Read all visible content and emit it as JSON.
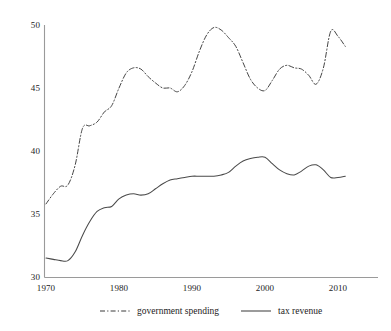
{
  "chart_data": {
    "type": "line",
    "title": "",
    "xlabel": "",
    "ylabel": "",
    "xlim": [
      1970,
      2011
    ],
    "ylim": [
      30,
      50
    ],
    "grid": false,
    "legend_position": "bottom",
    "xticks": [
      "1970",
      "1980",
      "1990",
      "2000",
      "2010"
    ],
    "xtick_values": [
      1970,
      1980,
      1990,
      2000,
      2010
    ],
    "yticks": [
      "30",
      "35",
      "40",
      "45",
      "50"
    ],
    "ytick_values": [
      30,
      35,
      40,
      45,
      50
    ],
    "x": [
      1970,
      1971,
      1972,
      1973,
      1974,
      1975,
      1976,
      1977,
      1978,
      1979,
      1980,
      1981,
      1982,
      1983,
      1984,
      1985,
      1986,
      1987,
      1988,
      1989,
      1990,
      1991,
      1992,
      1993,
      1994,
      1995,
      1996,
      1997,
      1998,
      1999,
      2000,
      2001,
      2002,
      2003,
      2004,
      2005,
      2006,
      2007,
      2008,
      2009,
      2010,
      2011
    ],
    "series": [
      {
        "name": "government spending",
        "style": "dashdot",
        "color": "#3a3a3a",
        "values": [
          35.8,
          36.6,
          37.2,
          37.3,
          38.9,
          41.8,
          42.0,
          42.3,
          43.1,
          43.6,
          45.0,
          46.2,
          46.6,
          46.5,
          45.9,
          45.4,
          45.0,
          45.0,
          44.7,
          45.2,
          46.3,
          47.9,
          49.2,
          49.8,
          49.6,
          49.0,
          48.3,
          47.0,
          45.7,
          45.0,
          44.8,
          45.6,
          46.5,
          46.8,
          46.6,
          46.5,
          46.0,
          45.3,
          46.6,
          49.5,
          49.1,
          48.3
        ]
      },
      {
        "name": "tax revenue",
        "style": "solid",
        "color": "#4a4a4a",
        "values": [
          31.5,
          31.4,
          31.3,
          31.3,
          32.0,
          33.3,
          34.4,
          35.2,
          35.5,
          35.6,
          36.2,
          36.5,
          36.6,
          36.5,
          36.6,
          37.0,
          37.4,
          37.7,
          37.8,
          37.9,
          38.0,
          38.0,
          38.0,
          38.0,
          38.1,
          38.3,
          38.8,
          39.2,
          39.4,
          39.5,
          39.5,
          39.0,
          38.5,
          38.2,
          38.1,
          38.4,
          38.8,
          38.9,
          38.5,
          37.9,
          37.9,
          38.0
        ]
      }
    ]
  },
  "legend": {
    "entries": [
      {
        "label": "government spending",
        "swatch": "dashdot-line-icon"
      },
      {
        "label": "tax revenue",
        "swatch": "solid-line-icon"
      }
    ]
  },
  "axes": {
    "y_tick_labels": [
      "50",
      "45",
      "40",
      "35",
      "30"
    ],
    "x_tick_labels": [
      "1970",
      "1980",
      "1990",
      "2000",
      "2010"
    ]
  },
  "top_strip": {
    "faint_text": "                    "
  }
}
